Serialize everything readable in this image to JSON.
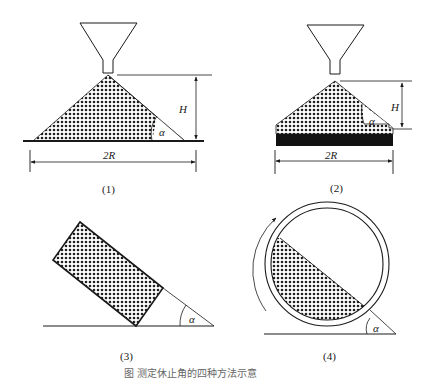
{
  "figure": {
    "caption": "图 测定休止角的四种方法示意",
    "panels": [
      {
        "id": "1",
        "label": "(1)",
        "height_label": "H",
        "width_label": "2R",
        "angle_label": "α",
        "description": "funnel pouring onto flat plate, fixed height"
      },
      {
        "id": "2",
        "label": "(2)",
        "height_label": "H",
        "width_label": "2R",
        "angle_label": "α",
        "description": "funnel pouring onto fixed-diameter base"
      },
      {
        "id": "3",
        "label": "(3)",
        "angle_label": "α",
        "description": "tilting box method"
      },
      {
        "id": "4",
        "label": "(4)",
        "angle_label": "α",
        "description": "rotating cylinder method"
      }
    ]
  },
  "colors": {
    "line": "#1a1a1a",
    "fill_dot": "#222222",
    "base_block": "#111111"
  }
}
